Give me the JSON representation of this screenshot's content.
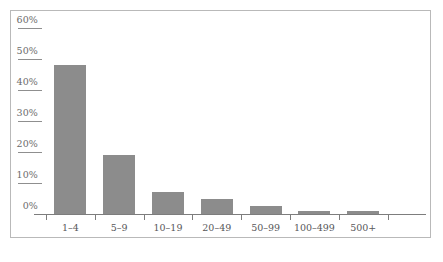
{
  "chart_data": {
    "type": "bar",
    "title": "",
    "subtitle": "",
    "xlabel": "",
    "ylabel": "",
    "categories": [
      "1–4",
      "5–9",
      "10–19",
      "20–49",
      "50–99",
      "100–499",
      "500+"
    ],
    "values": [
      48,
      19,
      7,
      5,
      2.5,
      1,
      1
    ],
    "ytick_labels": [
      "60%",
      "50%",
      "40%",
      "30%",
      "20%",
      "10%",
      "0%"
    ],
    "ytick_values": [
      60,
      50,
      40,
      30,
      20,
      10,
      0
    ],
    "ylim": [
      0,
      60
    ],
    "grid": false,
    "legend": null,
    "bar_color": "#8c8c8c",
    "axis_color": "#7d7d7d",
    "label_color": "#58585a",
    "frame_color": "#b9b9b9"
  },
  "caption": {
    "text": ""
  }
}
